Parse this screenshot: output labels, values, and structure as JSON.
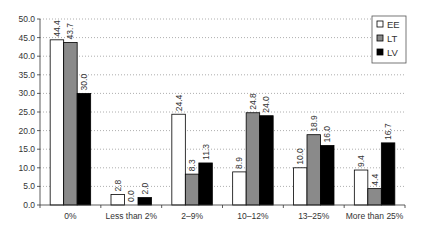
{
  "chart_data": {
    "type": "bar",
    "title": "",
    "xlabel": "",
    "ylabel": "",
    "ylim": [
      0,
      50
    ],
    "yticks": [
      "0.0",
      "5.0",
      "10.0",
      "15.0",
      "20.0",
      "25.0",
      "30.0",
      "35.0",
      "40.0",
      "45.0",
      "50.0"
    ],
    "grid": "horizontal dotted",
    "legend_position": "top-right",
    "categories": [
      "0%",
      "Less than 2%",
      "2–9%",
      "10–12%",
      "13–25%",
      "More than 25%"
    ],
    "series": [
      {
        "name": "EE",
        "color": "#ffffff",
        "values": [
          44.4,
          2.8,
          24.4,
          8.9,
          10.0,
          9.4
        ]
      },
      {
        "name": "LT",
        "color": "#8a8a8a",
        "values": [
          43.7,
          0.0,
          8.3,
          24.8,
          18.9,
          4.4
        ]
      },
      {
        "name": "LV",
        "color": "#000000",
        "values": [
          30.0,
          2.0,
          11.3,
          24.0,
          16.0,
          16.7
        ]
      }
    ],
    "value_labels": [
      [
        "44.4",
        "2.8",
        "24.4",
        "8.9",
        "10.0",
        "9.4"
      ],
      [
        "43.7",
        "0.0",
        "8.3",
        "24.8",
        "18.9",
        "4.4"
      ],
      [
        "30.0",
        "2.0",
        "11.3",
        "24.0",
        "16.0",
        "16.7"
      ]
    ]
  }
}
